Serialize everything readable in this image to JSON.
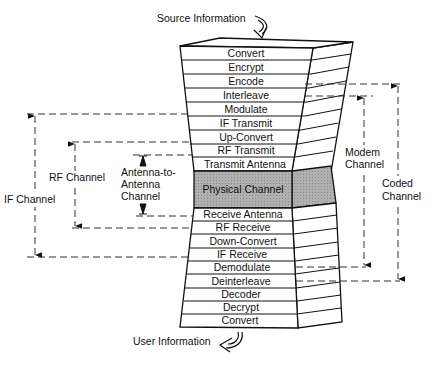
{
  "diagram": {
    "source_label": "Source Information",
    "user_label": "User Information",
    "transmit_stack": [
      "Convert",
      "Encrypt",
      "Encode",
      "Interleave",
      "Modulate",
      "IF Transmit",
      "Up-Convert",
      "RF Transmit",
      "Transmit Antenna"
    ],
    "physical_channel": "Physical Channel",
    "receive_stack": [
      "Receive Antenna",
      "RF Receive",
      "Down-Convert",
      "IF Receive",
      "Demodulate",
      "Deinterleave",
      "Decoder",
      "Decrypt",
      "Convert"
    ],
    "channels": {
      "if_channel": "IF Channel",
      "rf_channel": "RF Channel",
      "antenna_channel": [
        "Antenna-to-",
        "Antenna",
        "Channel"
      ],
      "modem_channel": [
        "Modem",
        "Channel"
      ],
      "coded_channel": [
        "Coded",
        "Channel"
      ]
    },
    "colors": {
      "line": "#111111",
      "physical_fill": "#a9a9a9"
    }
  }
}
